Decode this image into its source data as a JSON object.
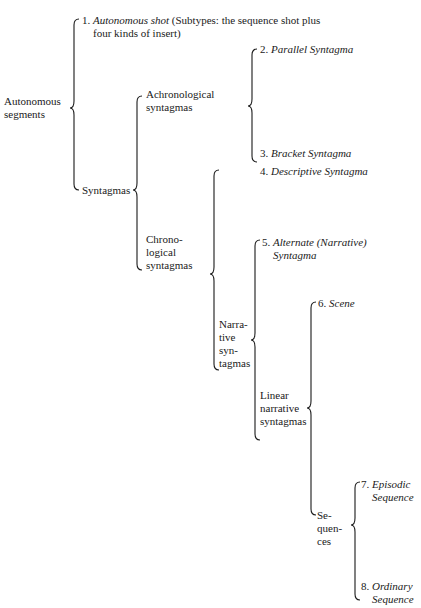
{
  "diagram": {
    "type": "tree-braces",
    "root": {
      "label_line1": "Autonomous",
      "label_line2": "segments"
    },
    "nodes": {
      "autonomous_shot": {
        "number": "1.",
        "title": "Autonomous shot",
        "desc_line1": "(Subtypes: the sequence shot plus",
        "desc_line2": "four kinds of insert)"
      },
      "syntagmas": {
        "label": "Syntagmas"
      },
      "achronological": {
        "line1": "Achronological",
        "line2": "syntagmas"
      },
      "parallel": {
        "number": "2.",
        "title": "Parallel Syntagma"
      },
      "bracket": {
        "number": "3.",
        "title": "Bracket Syntagma"
      },
      "chronological": {
        "line1": "Chrono-",
        "line2": "logical",
        "line3": "syntagmas"
      },
      "descriptive": {
        "number": "4.",
        "title": "Descriptive Syntagma"
      },
      "narrative": {
        "line1": "Narra-",
        "line2": "tive",
        "line3": "syn-",
        "line4": "tagmas"
      },
      "alternate": {
        "number": "5.",
        "title_line1": "Alternate (Narrative)",
        "title_line2": "Syntagma"
      },
      "linear": {
        "line1": "Linear",
        "line2": "narrative",
        "line3": "syntagmas"
      },
      "scene": {
        "number": "6.",
        "title": "Scene"
      },
      "sequences": {
        "line1": "Se-",
        "line2": "quen-",
        "line3": "ces"
      },
      "episodic": {
        "number": "7.",
        "title_line1": "Episodic",
        "title_line2": "Sequence"
      },
      "ordinary": {
        "number": "8.",
        "title_line1": "Ordinary",
        "title_line2": "Sequence"
      }
    }
  }
}
